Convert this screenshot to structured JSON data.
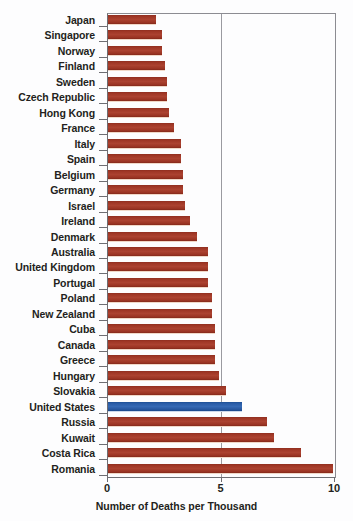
{
  "chart_data": {
    "type": "bar",
    "orientation": "horizontal",
    "title": "",
    "xlabel": "Number of Deaths per Thousand",
    "ylabel": "",
    "xlim": [
      0,
      10
    ],
    "xticks": [
      "0",
      "5",
      "10"
    ],
    "xtick_values": [
      0,
      5,
      10
    ],
    "grid": "vertical gridline at x=5",
    "legend": "none",
    "categories": [
      "Japan",
      "Singapore",
      "Norway",
      "Finland",
      "Sweden",
      "Czech Republic",
      "Hong Kong",
      "France",
      "Italy",
      "Spain",
      "Belgium",
      "Germany",
      "Israel",
      "Ireland",
      "Denmark",
      "Australia",
      "United Kingdom",
      "Portugal",
      "Poland",
      "New Zealand",
      "Cuba",
      "Canada",
      "Greece",
      "Hungary",
      "Slovakia",
      "United States",
      "Russia",
      "Kuwait",
      "Costa Rica",
      "Romania"
    ],
    "values": [
      2.1,
      2.4,
      2.4,
      2.5,
      2.6,
      2.6,
      2.7,
      2.9,
      3.2,
      3.2,
      3.3,
      3.3,
      3.4,
      3.6,
      3.9,
      4.4,
      4.4,
      4.4,
      4.6,
      4.6,
      4.7,
      4.7,
      4.7,
      4.9,
      5.2,
      5.9,
      7.0,
      7.3,
      8.5,
      9.9
    ],
    "highlight_category": "United States",
    "colors": {
      "bar": "#9c3524",
      "bar_highlight": "#2a5da8",
      "axis": "#6e6e73",
      "gridline": "#9a9aa0",
      "text": "#231f20",
      "background": "#fdfdfe"
    }
  }
}
